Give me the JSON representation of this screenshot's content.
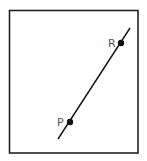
{
  "diagram": {
    "frame": {
      "x": 9,
      "y": 10,
      "width": 129,
      "height": 143,
      "stroke": "#222222"
    },
    "line": {
      "x1": 58,
      "y1": 139,
      "x2": 130,
      "y2": 28,
      "stroke": "#111111"
    },
    "points": [
      {
        "label": "P",
        "cx": 70,
        "cy": 122,
        "label_x": 57,
        "label_y": 126
      },
      {
        "label": "R",
        "cx": 121,
        "cy": 43,
        "label_x": 108,
        "label_y": 47
      }
    ]
  }
}
